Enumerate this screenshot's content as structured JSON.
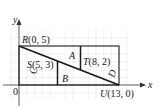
{
  "axes": {
    "x_label": "x",
    "y_label": "y",
    "origin_label": "0"
  },
  "points": {
    "R": {
      "name": "R",
      "coords": "(0, 5)",
      "x": 0,
      "y": 5
    },
    "S": {
      "name": "S",
      "coords": "(5, 3)",
      "x": 5,
      "y": 3
    },
    "T": {
      "name": "T",
      "coords": "(8, 2)",
      "x": 8,
      "y": 2
    },
    "U": {
      "name": "U",
      "coords": "(13, 0)",
      "x": 13,
      "y": 0
    }
  },
  "regions": {
    "A": "A",
    "B": "B",
    "C": "C",
    "D": "D"
  },
  "rectangle": {
    "x_min": 0,
    "x_max": 13,
    "y_min": 0,
    "y_max": 5
  },
  "colors": {
    "line": "#1a1a1a",
    "grid": "#c8c8c8",
    "axis": "#333333"
  }
}
